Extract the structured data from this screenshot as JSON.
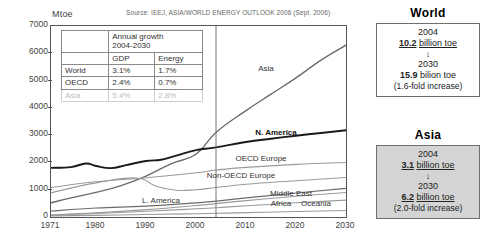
{
  "chart_data": {
    "type": "line",
    "title": "",
    "source": "Source: IEEJ, ASIA/WORLD ENERGY OUTLOOK 2006 (Sept. 2006)",
    "ylabel": "Mtoe",
    "xlabel": "",
    "ylim": [
      0,
      7000
    ],
    "yticks": [
      0,
      1000,
      2000,
      3000,
      4000,
      5000,
      6000,
      7000
    ],
    "xlim": [
      1971,
      2030
    ],
    "xticks": [
      1971,
      1980,
      1990,
      2000,
      2010,
      2020,
      2030
    ],
    "grid": false,
    "legend_position": "inline-labels",
    "forecast_divider_year": 2004,
    "annotations": [
      {
        "text": "Asia",
        "year": 2014,
        "value": 5400,
        "bold": false
      },
      {
        "text": "N. America",
        "year": 2016,
        "value": 3050,
        "bold": true
      },
      {
        "text": "OECD Europe",
        "year": 2013,
        "value": 2080,
        "bold": false
      },
      {
        "text": "Non-OECD Europe",
        "year": 2009,
        "value": 1480,
        "bold": false
      },
      {
        "text": "Middle East",
        "year": 2019,
        "value": 810,
        "bold": false
      },
      {
        "text": "Africa",
        "year": 2017,
        "value": 430,
        "bold": false
      },
      {
        "text": "Oceania",
        "year": 2024,
        "value": 430,
        "bold": false
      },
      {
        "text": "L. America",
        "year": 1993,
        "value": 560,
        "bold": false
      }
    ],
    "series": [
      {
        "name": "Asia",
        "color": "#6b6b6b",
        "width": 1.4,
        "x": [
          1971,
          1975,
          1980,
          1985,
          1990,
          1995,
          2000,
          2004,
          2010,
          2015,
          2020,
          2025,
          2030
        ],
        "values": [
          520,
          700,
          900,
          1150,
          1500,
          1950,
          2300,
          3100,
          3900,
          4500,
          5100,
          5750,
          6300
        ]
      },
      {
        "name": "N. America",
        "color": "#1a1a1a",
        "width": 1.9,
        "x": [
          1971,
          1975,
          1978,
          1980,
          1983,
          1986,
          1990,
          1993,
          1996,
          2000,
          2004,
          2010,
          2015,
          2020,
          2025,
          2030
        ],
        "values": [
          1800,
          1830,
          1960,
          1870,
          1790,
          1900,
          2050,
          2100,
          2250,
          2450,
          2550,
          2750,
          2870,
          2980,
          3080,
          3180
        ]
      },
      {
        "name": "OECD Europe",
        "color": "#9a9a9a",
        "width": 1.1,
        "x": [
          1971,
          1980,
          1990,
          2000,
          2004,
          2010,
          2020,
          2030
        ],
        "values": [
          1080,
          1290,
          1440,
          1620,
          1720,
          1820,
          1930,
          2000
        ]
      },
      {
        "name": "Non-OECD Europe",
        "color": "#9a9a9a",
        "width": 1.1,
        "x": [
          1971,
          1980,
          1988,
          1992,
          1996,
          2000,
          2004,
          2010,
          2020,
          2030
        ],
        "values": [
          890,
          1250,
          1430,
          1130,
          980,
          1000,
          1080,
          1200,
          1330,
          1450
        ]
      },
      {
        "name": "L. America",
        "color": "#6b6b6b",
        "width": 1.2,
        "x": [
          1971,
          1980,
          1990,
          2000,
          2004,
          2010,
          2020,
          2030
        ],
        "values": [
          220,
          330,
          400,
          520,
          580,
          700,
          880,
          1050
        ]
      },
      {
        "name": "Middle East",
        "color": "#9a9a9a",
        "width": 1.1,
        "x": [
          1971,
          1980,
          1990,
          2000,
          2004,
          2010,
          2020,
          2030
        ],
        "values": [
          70,
          150,
          270,
          420,
          490,
          600,
          760,
          900
        ]
      },
      {
        "name": "Africa",
        "color": "#9a9a9a",
        "width": 1.1,
        "x": [
          1971,
          1980,
          1990,
          2000,
          2004,
          2010,
          2020,
          2030
        ],
        "values": [
          70,
          130,
          210,
          300,
          340,
          410,
          520,
          620
        ]
      },
      {
        "name": "Oceania",
        "color": "#9a9a9a",
        "width": 1.1,
        "x": [
          1971,
          1980,
          1990,
          2000,
          2004,
          2010,
          2020,
          2030
        ],
        "values": [
          40,
          60,
          90,
          120,
          135,
          160,
          200,
          240
        ]
      }
    ]
  },
  "growth_table": {
    "header_main": "Annual growth 2004-2030",
    "header_main_line1": "Annual growth",
    "header_main_line2": "2004-2030",
    "col_gdp": "GDP",
    "col_energy": "Energy",
    "rows": [
      {
        "name": "World",
        "gdp": "3.1%",
        "energy": "1.7%",
        "dimmed": false
      },
      {
        "name": "OECD",
        "gdp": "2.4%",
        "energy": "0.7%",
        "dimmed": false
      },
      {
        "name": "Asia",
        "gdp": "5.4%",
        "energy": "2.8%",
        "dimmed": true
      }
    ]
  },
  "side_boxes": [
    {
      "title": "World",
      "shaded": false,
      "year_from": "2004",
      "value_from_num": "10.2",
      "value_from_unit": "billion toe",
      "arrow": "↓",
      "year_to": "2030",
      "value_to_num": "15.9",
      "value_to_unit": "bilion toe",
      "note": "(1.6-fold increase)"
    },
    {
      "title": "Asia",
      "shaded": true,
      "year_from": "2004",
      "value_from_num": "3.1",
      "value_from_unit": "billion toe",
      "arrow": "↓",
      "year_to": "2030",
      "value_to_num": "6.2",
      "value_to_unit": "billion toe",
      "note": "(2.0-fold increase)"
    }
  ]
}
